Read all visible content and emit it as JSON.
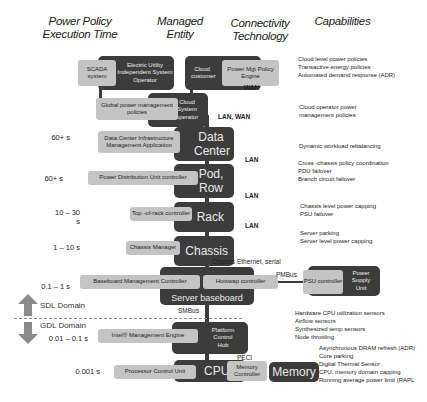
{
  "headers": {
    "time": "Power Policy\nExecution Time",
    "time_l1": "Power Policy",
    "time_l2": "Execution Time",
    "entity_l1": "Managed",
    "entity_l2": "Entity",
    "conn_l1": "Connectivity",
    "conn_l2": "Technology",
    "capabilities": "Capabilities"
  },
  "levels": {
    "utility": {
      "entity": "Electric Utility Independent System Operator",
      "controller": "SCADA system"
    },
    "cloud_customer": {
      "entity": "Cloud customer",
      "controller": "Power Mgt Policy Engine"
    },
    "cloud_operator": {
      "entity": "Cloud System operator",
      "controller": "Global power management policies"
    },
    "data_center": {
      "time": "60+ s",
      "entity": "Data Center",
      "controller": "Data Center Infrastructure Management Application"
    },
    "pod_row": {
      "time": "60+ s",
      "entity": "Pod, Row",
      "controller": "Power Distribution Unit controller"
    },
    "rack": {
      "time": "10 – 30 s",
      "entity": "Rack",
      "controller": "Top -of-rack controller"
    },
    "chassis": {
      "time": "1 – 10 s",
      "entity": "Chassis",
      "controller": "Chassis Manager"
    },
    "server": {
      "time": "0.1 – 1 s",
      "entity": "Server baseboard",
      "controller": "Baseboard Management Controller",
      "controller2": "Hotswap  controller"
    },
    "psu": {
      "entity": "Power Supply Unit",
      "controller": "PSU controller"
    },
    "pch": {
      "time": "0.01 – 0.1 s",
      "entity": "Platform Control Hub",
      "controller": "Intel® Management Engine"
    },
    "cpu": {
      "time": "0.001 s",
      "entity": "CPU",
      "controller": "Processor Control Unit",
      "controller2": "Memory Controller"
    },
    "memory": {
      "entity": "Memory"
    }
  },
  "connectivity": {
    "wan": "WAN",
    "lan_wan": "LAN, WAN",
    "lan1": "LAN",
    "lan2": "LAN",
    "lan3": "LAN",
    "chassis_eth": "Chassis Ethernet, serial",
    "pmbus": "PMBus",
    "smbus": "SMBus",
    "peci": "PECI"
  },
  "domains": {
    "sdl": "SDL Domain",
    "gdl": "GDL Domain"
  },
  "capabilities": {
    "cloud": [
      "Cloud level power policies",
      "Transactive  energy policies",
      "Automated demand response (ADR)"
    ],
    "operator": [
      "Cloud operator power",
      "management policies"
    ],
    "datacenter": [
      "Dynamic workload rebalancing"
    ],
    "pod": [
      "Cross -chassis policy  coordination",
      "PDU failover",
      "Branch circuit failover"
    ],
    "rack": [
      "Chassis level power capping",
      "PSU failover"
    ],
    "chassis": [
      "Server parking",
      "Server level  power capping"
    ],
    "server": [
      "Hardware CPU utilization     sensors",
      "Airflow   sensors",
      "Synthesized temp sensors",
      "Node  throttling"
    ],
    "cpu": [
      "Asynchronous DRAM refresh (ADR)",
      "Core  parking",
      "Digital Thermal Sensor",
      "CPU, memory    domain  capping",
      "Running average power limit (RAPL"
    ]
  },
  "colors": {
    "dark_box": "#3c3c3c",
    "light_box": "#c4c4c4",
    "arrow": "#8a8a8a"
  }
}
